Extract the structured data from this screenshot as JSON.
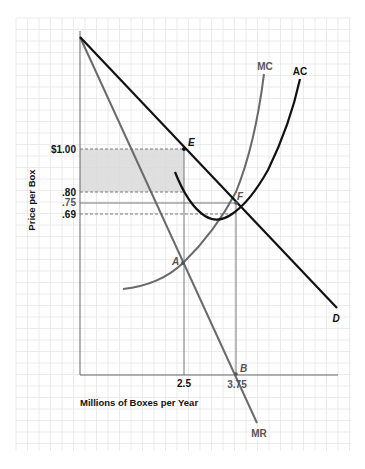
{
  "chart_data": {
    "type": "line",
    "title": "",
    "xlabel": "Millions of Boxes per Year",
    "ylabel": "Price per Box",
    "x_ticks": [
      "2.5",
      "3.75"
    ],
    "y_ticks": [
      "$1.00",
      ".80",
      ".75",
      ".69"
    ],
    "grid": true,
    "legend": "inline curve labels",
    "series": [
      {
        "name": "D",
        "description": "Demand curve (black, linear, downward sloping)",
        "points": [
          [
            0,
            1.72
          ],
          [
            2.5,
            1.0
          ],
          [
            3.75,
            0.75
          ],
          [
            6.0,
            0.3
          ]
        ]
      },
      {
        "name": "MR",
        "description": "Marginal revenue (gray, linear, steeper)",
        "points": [
          [
            0,
            1.72
          ],
          [
            2.5,
            0.46
          ],
          [
            3.75,
            0.0
          ],
          [
            4.4,
            -0.33
          ]
        ]
      },
      {
        "name": "MC",
        "description": "Marginal cost (gray, upward curving)",
        "points": [
          [
            1.0,
            0.34
          ],
          [
            2.5,
            0.46
          ],
          [
            3.5,
            0.78
          ],
          [
            4.2,
            1.25
          ],
          [
            4.5,
            1.8
          ]
        ]
      },
      {
        "name": "AC",
        "description": "Average cost (black, U-shaped)",
        "points": [
          [
            2.3,
            0.85
          ],
          [
            3.0,
            0.66
          ],
          [
            3.75,
            0.69
          ],
          [
            4.5,
            0.95
          ],
          [
            5.3,
            1.75
          ]
        ]
      }
    ],
    "points": [
      {
        "label": "E",
        "x": 2.5,
        "y": 1.0,
        "on": "D"
      },
      {
        "label": "F",
        "x": 3.75,
        "y": 0.75,
        "on": "D"
      },
      {
        "label": "A",
        "x": 2.5,
        "y": 0.46,
        "on": "MR/MC"
      },
      {
        "label": "B",
        "x": 3.75,
        "y": 0.0,
        "on": "MR"
      }
    ],
    "shaded_region": {
      "x_range": [
        0,
        2.5
      ],
      "y_range": [
        0.8,
        1.0
      ],
      "meaning": "profit rectangle",
      "color": "#dcdcdc"
    },
    "reference_lines": [
      {
        "y": 1.0,
        "style": "dashed",
        "x_to": 2.5
      },
      {
        "y": 0.8,
        "style": "dashed",
        "x_to": 2.5
      },
      {
        "y": 0.75,
        "style": "solid",
        "x_to": 3.75
      },
      {
        "y": 0.69,
        "style": "dashed",
        "x_to": 3.75
      },
      {
        "x": 2.5,
        "style": "solid",
        "y_to": 1.0
      },
      {
        "x": 3.75,
        "style": "solid",
        "y_to": 0.75
      }
    ]
  },
  "labels": {
    "y_axis_title": "Price per Box",
    "x_axis_title": "Millions of Boxes per Year",
    "tick_100": "$1.00",
    "tick_80": ".80",
    "tick_75": ".75",
    "tick_69": ".69",
    "tick_x1": "2.5",
    "tick_x2": "3.75",
    "curve_mc": "MC",
    "curve_ac": "AC",
    "curve_d": "D",
    "curve_mr": "MR",
    "pt_e": "E",
    "pt_f": "F",
    "pt_a": "A",
    "pt_b": "B"
  },
  "colors": {
    "black_curve": "#111111",
    "gray_curve": "#6a6a6a",
    "shade": "#dcdcdc",
    "grid": "#e6e6e6",
    "ref_line": "#777777"
  }
}
